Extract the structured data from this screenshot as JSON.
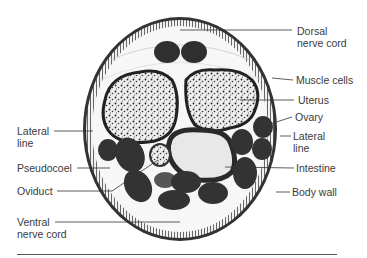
{
  "diagram": {
    "labels": {
      "dorsal_nerve_cord": [
        "Dorsal",
        "nerve cord"
      ],
      "muscle_cells": "Muscle cells",
      "uterus": "Uterus",
      "ovary": "Ovary",
      "lateral_line_left": [
        "Lateral",
        "line"
      ],
      "lateral_line_right": [
        "Lateral",
        "line"
      ],
      "pseudocoel": "Pseudocoel",
      "intestine": "Intestine",
      "oviduct": "Oviduct",
      "body_wall": "Body wall",
      "ventral_nerve_cord": [
        "Ventral",
        "nerve cord"
      ]
    }
  }
}
